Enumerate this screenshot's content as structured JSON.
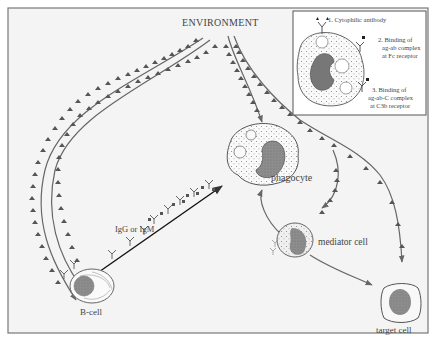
{
  "figure": {
    "environment_label": "ENVIRONMENT",
    "cells": {
      "phagocyte": "phagocyte",
      "b_cell": "B-cell",
      "mediator_cell": "mediator cell",
      "target_cell": "target cell"
    },
    "antibody_label": "IgG or IgM",
    "inset": {
      "items": [
        {
          "number": "1.",
          "text": "Cytophilic antibody"
        },
        {
          "number": "2.",
          "line1": "Binding of",
          "line2": "ag-ab complex",
          "line3": "at Fc receptor"
        },
        {
          "number": "3.",
          "line1": "Binding of",
          "line2": "ag-ab-C complex",
          "line3": "at C3b receptor"
        }
      ]
    },
    "colors": {
      "background": "#f4f4f4",
      "frame": "#777777",
      "nucleus": "#8a8a8a",
      "arrow": "#111111",
      "text": "#444444"
    }
  }
}
